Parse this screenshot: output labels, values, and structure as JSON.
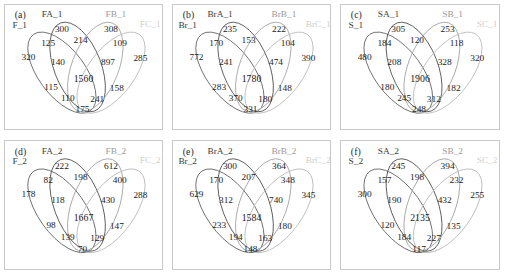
{
  "figure": {
    "type": "venn-diagram-grid",
    "rows": 2,
    "cols": 3,
    "background": "#ffffff",
    "frame_color": "#c9c9c9"
  },
  "chart_data": {
    "type": "table",
    "title": "",
    "xlabel": "",
    "ylabel": "",
    "region_order": [
      "A_only",
      "AB",
      "B_only",
      "ABC",
      "BC",
      "A_left_only",
      "ABD",
      "BCD",
      "C_only",
      "ABCD",
      "AD",
      "CD",
      "ACD",
      "ACD2",
      "D_bottom"
    ],
    "panels": [
      {
        "tag": "(a)",
        "sets": [
          "F_1",
          "FA_1",
          "FB_1",
          "FC_1"
        ],
        "set_label_shades": [
          "dark",
          "dark",
          "mid",
          "light"
        ],
        "counts": {
          "top_a": "300",
          "top_b": "308",
          "upper_left": "125",
          "upper_center": "214",
          "upper_right": "109",
          "far_left": "320",
          "mid_left": "140",
          "mid_right": "897",
          "far_right": "285",
          "center": "1560",
          "low_left": "115",
          "low_right": "158",
          "bottom_left": "110",
          "bottom_right": "241",
          "bottom_center": "175"
        }
      },
      {
        "tag": "(b)",
        "sets": [
          "Br_1",
          "BrA_1",
          "BrB_1",
          "BrC_1"
        ],
        "set_label_shades": [
          "dark",
          "dark",
          "mid",
          "light"
        ],
        "counts": {
          "top_a": "235",
          "top_b": "222",
          "upper_left": "170",
          "upper_center": "153",
          "upper_right": "104",
          "far_left": "772",
          "mid_left": "241",
          "mid_right": "474",
          "far_right": "390",
          "center": "1780",
          "low_left": "283",
          "low_right": "148",
          "bottom_left": "370",
          "bottom_right": "180",
          "bottom_center": "331"
        }
      },
      {
        "tag": "(c)",
        "sets": [
          "S_1",
          "SA_1",
          "SB_1",
          "SC_1"
        ],
        "set_label_shades": [
          "dark",
          "dark",
          "mid",
          "light"
        ],
        "counts": {
          "top_a": "305",
          "top_b": "253",
          "upper_left": "184",
          "upper_center": "120",
          "upper_right": "118",
          "far_left": "480",
          "mid_left": "208",
          "mid_right": "328",
          "far_right": "320",
          "center": "1906",
          "low_left": "180",
          "low_right": "182",
          "bottom_left": "245",
          "bottom_right": "312",
          "bottom_center": "248"
        }
      },
      {
        "tag": "(d)",
        "sets": [
          "F_2",
          "FA_2",
          "FB_2",
          "FC_2"
        ],
        "set_label_shades": [
          "dark",
          "dark",
          "mid",
          "light"
        ],
        "counts": {
          "top_a": "222",
          "top_b": "612",
          "upper_left": "82",
          "upper_center": "198",
          "upper_right": "400",
          "far_left": "178",
          "mid_left": "118",
          "mid_right": "430",
          "far_right": "288",
          "center": "1667",
          "low_left": "98",
          "low_right": "147",
          "bottom_left": "139",
          "bottom_right": "129",
          "bottom_center": "70"
        }
      },
      {
        "tag": "(e)",
        "sets": [
          "Br_2",
          "BrA_2",
          "BrB_2",
          "BrC_2"
        ],
        "set_label_shades": [
          "dark",
          "dark",
          "mid",
          "light"
        ],
        "counts": {
          "top_a": "300",
          "top_b": "364",
          "upper_left": "170",
          "upper_center": "207",
          "upper_right": "348",
          "far_left": "629",
          "mid_left": "312",
          "mid_right": "740",
          "far_right": "345",
          "center": "1584",
          "low_left": "233",
          "low_right": "180",
          "bottom_left": "194",
          "bottom_right": "163",
          "bottom_center": "148"
        }
      },
      {
        "tag": "(f)",
        "sets": [
          "S_2",
          "SA_2",
          "SB_2",
          "SC_2"
        ],
        "set_label_shades": [
          "dark",
          "dark",
          "mid",
          "light"
        ],
        "counts": {
          "top_a": "245",
          "top_b": "394",
          "upper_left": "157",
          "upper_center": "198",
          "upper_right": "232",
          "far_left": "300",
          "mid_left": "190",
          "mid_right": "432",
          "far_right": "255",
          "center": "2135",
          "low_left": "120",
          "low_right": "135",
          "bottom_left": "184",
          "bottom_right": "227",
          "bottom_center": "117"
        }
      }
    ]
  }
}
